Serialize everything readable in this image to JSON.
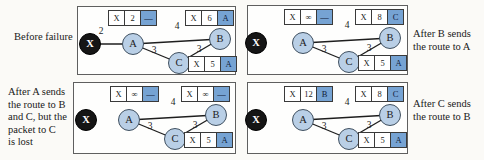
{
  "nodes": {
    "A": "A",
    "B": "B",
    "C": "C",
    "X": "X"
  },
  "panels": [
    {
      "name": "before-failure",
      "label_lines": [
        "Before failure"
      ],
      "x_edge_cost": "2",
      "edge_costs": {
        "ab": "4",
        "ac": "3",
        "cb": "3"
      },
      "tables": {
        "A": [
          "X",
          "2",
          "—"
        ],
        "B": [
          "X",
          "6",
          "A"
        ],
        "C": [
          "X",
          "5",
          "A"
        ]
      }
    },
    {
      "name": "after-b-sends-route-to-a",
      "label_lines": [
        "After B sends",
        "the route to A"
      ],
      "edge_costs": {
        "ab": "4",
        "ac": "3",
        "cb": "3"
      },
      "tables": {
        "A": [
          "X",
          "∞",
          "—"
        ],
        "B": [
          "X",
          "8",
          "C"
        ],
        "C": [
          "X",
          "5",
          "A"
        ]
      }
    },
    {
      "name": "after-a-sends-route-packet-lost",
      "label_lines": [
        "After A sends",
        "the route to B",
        "and C, but the",
        "packet to C",
        "is lost"
      ],
      "edge_costs": {
        "ab": "4",
        "ac": "3",
        "cb": "3"
      },
      "tables": {
        "A": [
          "X",
          "∞",
          "—"
        ],
        "B": [
          "X",
          "∞",
          "—"
        ],
        "C": [
          "X",
          "5",
          "A"
        ]
      }
    },
    {
      "name": "after-c-sends-route-to-b",
      "label_lines": [
        "After C sends",
        "the route to B"
      ],
      "edge_costs": {
        "ab": "4",
        "ac": "3",
        "cb": "3"
      },
      "tables": {
        "A": [
          "X",
          "12",
          "B"
        ],
        "B": [
          "X",
          "8",
          "C"
        ],
        "C": [
          "X",
          "5",
          "A"
        ]
      }
    }
  ],
  "colors": {
    "node_fill": "#b9cfe6",
    "x_node_fill": "#151515",
    "highlight_cell": "#76a3d3"
  }
}
